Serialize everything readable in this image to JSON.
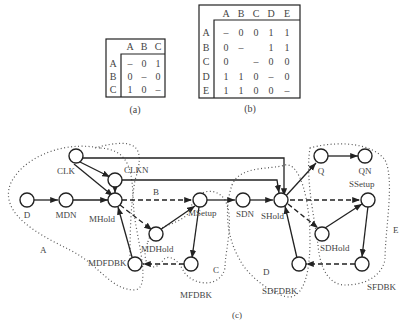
{
  "table_a": {
    "caption": "(a)",
    "headers": [
      "A",
      "B",
      "C"
    ],
    "rows": [
      {
        "label": "A",
        "cells": [
          "–",
          "0",
          "1"
        ]
      },
      {
        "label": "B",
        "cells": [
          "0",
          "–",
          "0"
        ]
      },
      {
        "label": "C",
        "cells": [
          "1",
          "0",
          "–"
        ]
      }
    ]
  },
  "table_b": {
    "caption": "(b)",
    "headers": [
      "A",
      "B",
      "C",
      "D",
      "E"
    ],
    "rows": [
      {
        "label": "A",
        "cells": [
          "–",
          "0",
          "0",
          "1",
          "1"
        ]
      },
      {
        "label": "B",
        "cells": [
          "0",
          "–",
          "",
          "1",
          "1"
        ]
      },
      {
        "label": "C",
        "cells": [
          "0",
          "",
          "–",
          "0",
          "0"
        ]
      },
      {
        "label": "D",
        "cells": [
          "1",
          "1",
          "0",
          "–",
          "0"
        ]
      },
      {
        "label": "E",
        "cells": [
          "1",
          "1",
          "0",
          "0",
          "–"
        ]
      }
    ]
  },
  "graph": {
    "caption": "(c)",
    "nodes": {
      "CLK": "CLK",
      "CLKN": "CLKN",
      "D": "D",
      "MDN": "MDN",
      "MHold": "MHold",
      "MDHold": "MDHold",
      "MSetup": "MSetup",
      "MDFDBK": "MDFDBK",
      "MFDBK": "MFDBK",
      "SDN": "SDN",
      "SHold": "SHold",
      "Q": "Q",
      "QN": "QN",
      "SSetup": "SSetup",
      "SDHold": "SDHold",
      "SDFDBK": "SDFDBK",
      "SFDBK": "SFDBK"
    },
    "regions": {
      "A": "A",
      "B": "B",
      "C": "C",
      "D": "D",
      "E": "E"
    }
  }
}
